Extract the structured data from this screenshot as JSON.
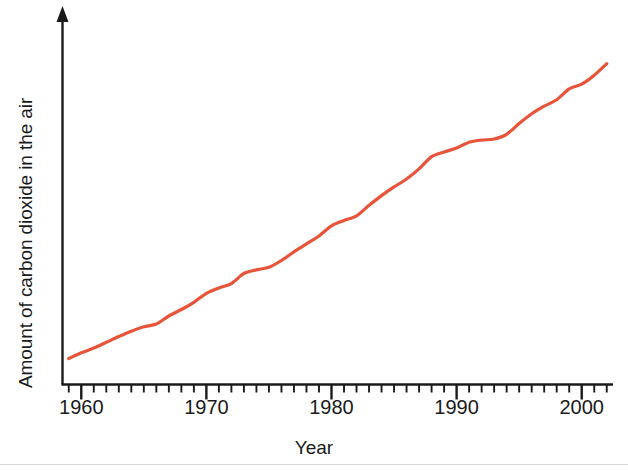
{
  "chart_data": {
    "type": "line",
    "title": "",
    "xlabel": "Year",
    "ylabel": "Amount of carbon dioxide in the air",
    "xlim": [
      1958.5,
      2002.5
    ],
    "ylim": [
      0,
      1
    ],
    "grid": false,
    "legend": null,
    "y_axis_has_ticks": false,
    "y_axis_has_numbers": false,
    "y_axis_arrow": true,
    "x_tick_labels": [
      "1960",
      "1970",
      "1980",
      "1990",
      "2000"
    ],
    "x_tick_label_years": [
      1960,
      1970,
      1980,
      1990,
      2000
    ],
    "x_minor_tick_interval_years": 1,
    "x_major_tick_interval_years": 10,
    "series": [
      {
        "name": "Amount of carbon dioxide in the air",
        "color": "#e8543a",
        "line_width": 3.2,
        "x": [
          1959,
          1960,
          1961,
          1962,
          1963,
          1964,
          1965,
          1966,
          1967,
          1968,
          1969,
          1970,
          1971,
          1972,
          1973,
          1974,
          1975,
          1976,
          1977,
          1978,
          1979,
          1980,
          1981,
          1982,
          1983,
          1984,
          1985,
          1986,
          1987,
          1988,
          1989,
          1990,
          1991,
          1992,
          1993,
          1994,
          1995,
          1996,
          1997,
          1998,
          1999,
          2000,
          2001,
          2002
        ],
        "y": [
          0.072,
          0.088,
          0.101,
          0.117,
          0.133,
          0.148,
          0.16,
          0.168,
          0.19,
          0.208,
          0.228,
          0.253,
          0.268,
          0.28,
          0.308,
          0.318,
          0.325,
          0.344,
          0.368,
          0.39,
          0.412,
          0.44,
          0.455,
          0.468,
          0.497,
          0.524,
          0.548,
          0.57,
          0.598,
          0.632,
          0.645,
          0.656,
          0.672,
          0.678,
          0.681,
          0.694,
          0.724,
          0.751,
          0.772,
          0.79,
          0.82,
          0.833,
          0.858,
          0.89
        ]
      }
    ]
  },
  "axes": {
    "y_axis_label": "Amount of carbon dioxide in the air",
    "x_axis_label": "Year",
    "axis_color": "#1a1a1a"
  },
  "colors": {
    "line": "#e8543a",
    "axis": "#1a1a1a",
    "background": "#ffffff",
    "rule": "#d8d8d8"
  },
  "tick_labels": {
    "t0": "1960",
    "t1": "1970",
    "t2": "1980",
    "t3": "1990",
    "t4": "2000"
  }
}
